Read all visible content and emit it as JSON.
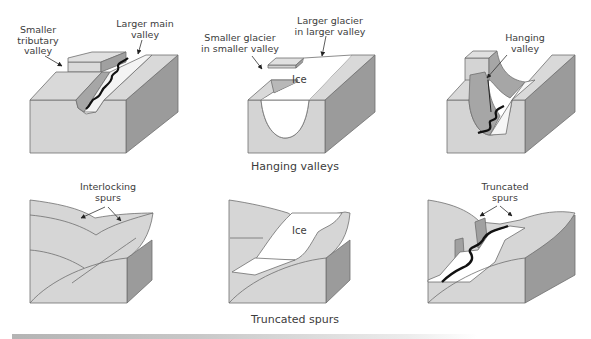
{
  "figure": {
    "rows": [
      {
        "caption": "Hanging valleys",
        "panels": [
          {
            "id": "hv-before",
            "labels": [
              {
                "name": "smaller-tributary-valley",
                "text": "Smaller\ntributary\nvalley"
              },
              {
                "name": "larger-main-valley",
                "text": "Larger main\nvalley"
              }
            ]
          },
          {
            "id": "hv-glaciated",
            "labels": [
              {
                "name": "smaller-glacier",
                "text": "Smaller glacier\nin smaller valley"
              },
              {
                "name": "larger-glacier",
                "text": "Larger glacier\nin larger valley"
              }
            ],
            "ice_label": "Ice"
          },
          {
            "id": "hv-after",
            "labels": [
              {
                "name": "hanging-valley",
                "text": "Hanging\nvalley"
              }
            ]
          }
        ]
      },
      {
        "caption": "Truncated spurs",
        "panels": [
          {
            "id": "ts-before",
            "labels": [
              {
                "name": "interlocking-spurs",
                "text": "Interlocking\nspurs"
              }
            ]
          },
          {
            "id": "ts-glaciated",
            "labels": [],
            "ice_label": "Ice"
          },
          {
            "id": "ts-after",
            "labels": [
              {
                "name": "truncated-spurs",
                "text": "Truncated\nspurs"
              }
            ]
          }
        ]
      }
    ],
    "colors": {
      "top_face": "#d9d9d9",
      "front_face": "#d4d4d4",
      "side_face": "#9a9a9a",
      "valley_wall": "#a8a8a8",
      "ice": "#ffffff",
      "river": "#1a1a1a",
      "outline": "#6e6e6e"
    }
  }
}
